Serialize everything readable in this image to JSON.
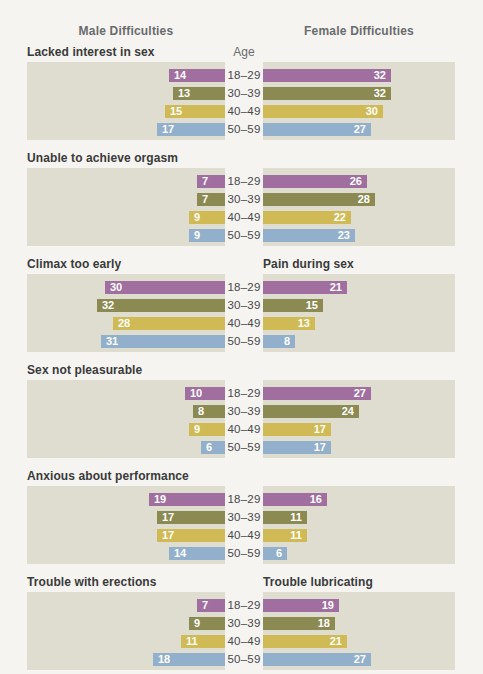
{
  "page": {
    "male_header": "Male Difficulties",
    "female_header": "Female Difficulties",
    "age_header": "Age"
  },
  "colors": {
    "panel_background": "#deddd0",
    "page_background": "#f5f4f1",
    "bar_value_text": "#ffffff",
    "section_label_text": "#3a3a3a",
    "header_text": "#6a6b6d"
  },
  "chart_data": {
    "type": "bar",
    "orientation": "horizontal, paired back-to-back (male left, female right)",
    "title_left": "Male Difficulties",
    "title_right": "Female Difficulties",
    "age_axis_label": "Age",
    "age_groups": [
      "18–29",
      "30–39",
      "40–49",
      "50–59"
    ],
    "age_group_colors": [
      "#a06e9f",
      "#8b8a52",
      "#cfba55",
      "#92afcb"
    ],
    "xmax": 48,
    "value_unit": "percent reporting difficulty",
    "sections": [
      {
        "male_label": "Lacked interest in sex",
        "female_label": "",
        "male_values": [
          14,
          13,
          15,
          17
        ],
        "female_values": [
          32,
          32,
          30,
          27
        ]
      },
      {
        "male_label": "Unable to achieve orgasm",
        "female_label": "",
        "male_values": [
          7,
          7,
          9,
          9
        ],
        "female_values": [
          26,
          28,
          22,
          23
        ]
      },
      {
        "male_label": "Climax too early",
        "female_label": "Pain during sex",
        "male_values": [
          30,
          32,
          28,
          31
        ],
        "female_values": [
          21,
          15,
          13,
          8
        ]
      },
      {
        "male_label": "Sex not pleasurable",
        "female_label": "",
        "male_values": [
          10,
          8,
          9,
          6
        ],
        "female_values": [
          27,
          24,
          17,
          17
        ]
      },
      {
        "male_label": "Anxious about performance",
        "female_label": "",
        "male_values": [
          19,
          17,
          17,
          14
        ],
        "female_values": [
          16,
          11,
          11,
          6
        ]
      },
      {
        "male_label": "Trouble with erections",
        "female_label": "Trouble lubricating",
        "male_values": [
          7,
          9,
          11,
          18
        ],
        "female_values": [
          19,
          18,
          21,
          27
        ]
      }
    ]
  }
}
